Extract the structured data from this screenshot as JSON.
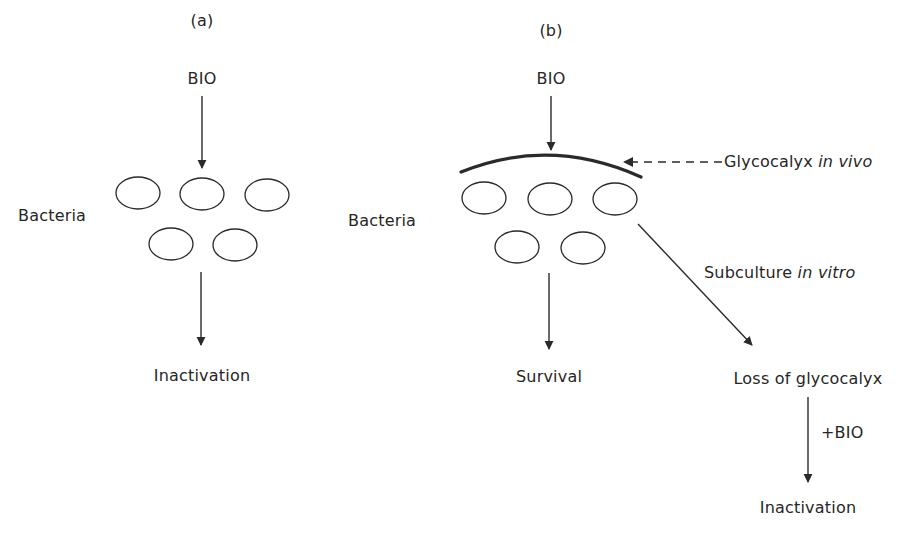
{
  "panels": {
    "a": {
      "label": "(a)",
      "input": "BIO",
      "subject": "Bacteria",
      "outcome": "Inactivation"
    },
    "b": {
      "label": "(b)",
      "input": "BIO",
      "subject": "Bacteria",
      "barrier_label_prefix": "Glycocalyx ",
      "barrier_label_italic": "in vivo",
      "outcome": "Survival",
      "branch_label_prefix": "Subculture ",
      "branch_label_italic": "in vitro",
      "branch_result": "Loss of glycocalyx",
      "branch_step": "+BIO",
      "branch_outcome": "Inactivation"
    }
  },
  "colors": {
    "stroke": "#2a2a2a",
    "text": "#262626",
    "background": "#ffffff"
  }
}
